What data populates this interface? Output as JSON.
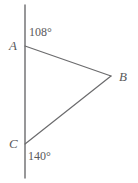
{
  "figure": {
    "type": "geometry-diagram",
    "width": 138,
    "height": 183,
    "background_color": "#ffffff",
    "stroke_color": "#6b6b6d",
    "text_color": "#59595b",
    "vertices": [
      {
        "name": "A",
        "label": "A",
        "x": 25,
        "y": 46
      },
      {
        "name": "B",
        "label": "B",
        "x": 111,
        "y": 76
      },
      {
        "name": "C",
        "label": "C",
        "x": 25,
        "y": 144
      }
    ],
    "transversal_line": {
      "name": "vertical-line",
      "x": 25,
      "y_top": 5,
      "y_bottom": 178
    },
    "segments": [
      {
        "name": "segment-AB",
        "from": "A",
        "to": "B",
        "x1": 25,
        "y1": 46,
        "x2": 111,
        "y2": 76
      },
      {
        "name": "segment-CB",
        "from": "C",
        "to": "B",
        "x1": 25,
        "y1": 144,
        "x2": 111,
        "y2": 76
      }
    ],
    "angle_labels": [
      {
        "name": "angle-at-A",
        "at_vertex": "A",
        "value": "108°",
        "position": "upper-right"
      },
      {
        "name": "angle-at-C",
        "at_vertex": "C",
        "value": "140°",
        "position": "lower-right"
      }
    ]
  }
}
